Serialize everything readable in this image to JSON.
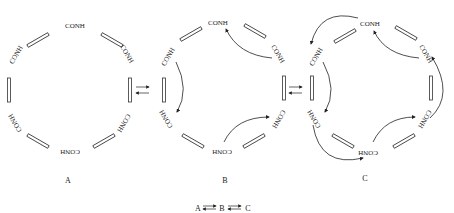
{
  "diagram": {
    "group_label": "CONH",
    "group_label_flipped": "HNOC",
    "rings": [
      {
        "id": "A",
        "label": "A"
      },
      {
        "id": "B",
        "label": "B"
      },
      {
        "id": "C",
        "label": "C"
      }
    ],
    "equation": {
      "a": "A",
      "b": "B",
      "c": "C"
    }
  }
}
